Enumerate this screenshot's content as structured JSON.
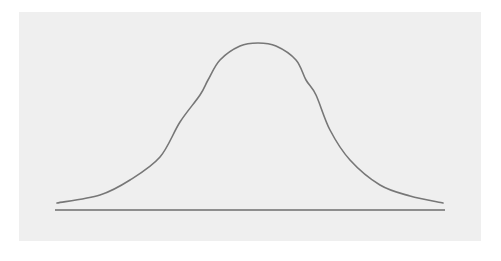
{
  "chart_data": {
    "type": "line",
    "title": "",
    "subtitle": "",
    "xlabel": "",
    "ylabel": "",
    "grid": false,
    "legend": null,
    "x_range_px": [
      57,
      443
    ],
    "baseline_y_px": 210,
    "series": [
      {
        "name": "normal-curve",
        "color": "#777777",
        "points_px": [
          [
            57,
            203
          ],
          [
            100,
            195
          ],
          [
            130,
            180
          ],
          [
            160,
            157
          ],
          [
            180,
            122
          ],
          [
            200,
            95
          ],
          [
            208,
            80
          ],
          [
            220,
            60
          ],
          [
            240,
            46
          ],
          [
            258,
            43
          ],
          [
            276,
            46
          ],
          [
            296,
            60
          ],
          [
            306,
            80
          ],
          [
            316,
            95
          ],
          [
            330,
            130
          ],
          [
            350,
            160
          ],
          [
            380,
            185
          ],
          [
            410,
            196
          ],
          [
            443,
            203
          ]
        ]
      }
    ],
    "baseline": {
      "x1": 55,
      "x2": 445,
      "y": 210,
      "color": "#6e6e6e"
    }
  },
  "colors": {
    "page_background": "#ffffff",
    "panel_background": "#efefef",
    "curve": "#777777",
    "baseline": "#6e6e6e"
  }
}
